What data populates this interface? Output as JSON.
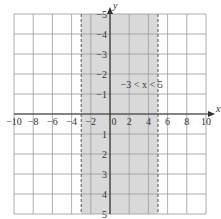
{
  "chart_data": {
    "type": "region",
    "title": "",
    "xlabel": "x",
    "ylabel": "y",
    "xlim": [
      -10,
      10
    ],
    "ylim": [
      -5,
      5
    ],
    "x_ticks": [
      -10,
      -8,
      -6,
      -4,
      -2,
      0,
      2,
      4,
      6,
      8,
      10
    ],
    "y_ticks": [
      -5,
      -4,
      -3,
      -2,
      -1,
      1,
      2,
      3,
      4,
      5
    ],
    "grid": true,
    "shaded_region": {
      "x_min": -3,
      "x_max": 5,
      "boundary_style": "dashed",
      "inclusive": false,
      "fill": "#d9d9d9"
    },
    "annotation": {
      "text": "−3 < x < 5",
      "x": 3.3,
      "y": 1.3
    }
  },
  "labels": {
    "x_axis": "x",
    "y_axis": "y",
    "inequality": "−3 < x < 5",
    "x_ticks": [
      "−10",
      "−8",
      "−6",
      "−4",
      "−2",
      "0",
      "2",
      "4",
      "6",
      "8",
      "10"
    ],
    "y_ticks": [
      "5",
      "4",
      "3",
      "2",
      "1",
      "−1",
      "−2",
      "−3",
      "−4",
      "−5"
    ]
  },
  "colors": {
    "grid": "#9a9a9a",
    "axis": "#333333",
    "shade": "#d9d9d9",
    "boundary": "#555555"
  }
}
